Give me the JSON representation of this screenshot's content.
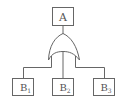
{
  "diagram": {
    "type": "fault-tree",
    "top_event": {
      "label": "A"
    },
    "gate": {
      "type": "OR"
    },
    "basic_events": [
      {
        "base": "B",
        "sub": "1"
      },
      {
        "base": "B",
        "sub": "2"
      },
      {
        "base": "B",
        "sub": "3"
      }
    ],
    "colors": {
      "stroke": "#666666",
      "text": "#555555",
      "background": "#ffffff"
    }
  }
}
